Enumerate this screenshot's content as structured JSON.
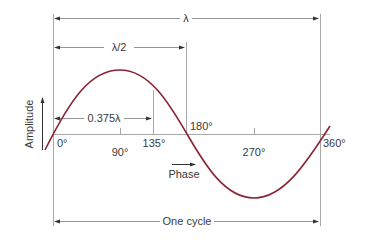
{
  "diagram": {
    "labels": {
      "wavelength": "λ",
      "half_wavelength": "λ/2",
      "fraction": "0.375λ",
      "amplitude_axis": "Amplitude",
      "phase_axis": "Phase",
      "one_cycle": "One cycle"
    },
    "phase_ticks": [
      {
        "label": "0°",
        "deg": 0
      },
      {
        "label": "90°",
        "deg": 90
      },
      {
        "label": "135°",
        "deg": 135
      },
      {
        "label": "180°",
        "deg": 180
      },
      {
        "label": "270°",
        "deg": 270
      },
      {
        "label": "360°",
        "deg": 360
      }
    ],
    "colors": {
      "wave": "#8b2332",
      "lines": "#9a9a9a",
      "text": "#3a3a3a",
      "arrows": "#333333"
    }
  }
}
